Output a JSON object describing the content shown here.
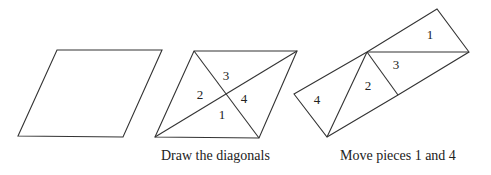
{
  "figures": [
    {
      "name": "parallelogram",
      "points": "18,136 57,50 162,50 123,137"
    },
    {
      "name": "parallelogram-with-diagonals",
      "outline": "155,137 194,51 297,51 259,138",
      "diagonals": [
        [
          194,
          51,
          259,
          138
        ],
        [
          155,
          137,
          297,
          51
        ]
      ],
      "labels": [
        {
          "text": "3",
          "x": 226,
          "y": 80
        },
        {
          "text": "2",
          "x": 200,
          "y": 99
        },
        {
          "text": "4",
          "x": 244,
          "y": 103
        },
        {
          "text": "1",
          "x": 222,
          "y": 119
        }
      ]
    },
    {
      "name": "rearranged-pieces",
      "outline": "294,94 367,52 437,9 469,52 398,95 327,137",
      "segments": [
        [
          367,
          52,
          469,
          52
        ],
        [
          367,
          52,
          327,
          137
        ],
        [
          367,
          52,
          398,
          95
        ]
      ],
      "labels": [
        {
          "text": "1",
          "x": 430,
          "y": 39
        },
        {
          "text": "3",
          "x": 396,
          "y": 69
        },
        {
          "text": "2",
          "x": 368,
          "y": 90
        },
        {
          "text": "4",
          "x": 317,
          "y": 104
        }
      ]
    }
  ],
  "captions": {
    "middle": "Draw the diagonals",
    "right": "Move pieces 1 and 4"
  },
  "colors": {
    "stroke": "#333333",
    "text": "#222222"
  }
}
